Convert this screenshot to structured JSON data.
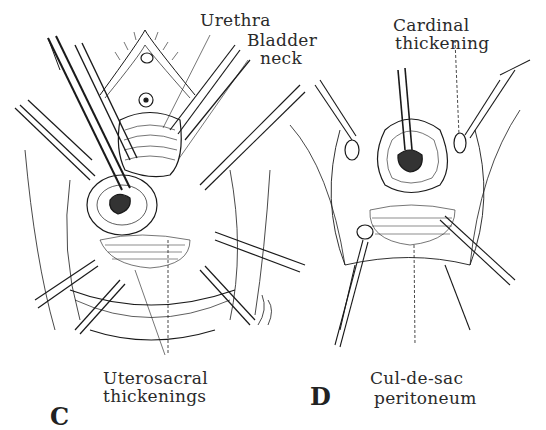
{
  "figure": {
    "panels": [
      {
        "id": "C",
        "letter": "C",
        "labels": {
          "urethra": "Urethra",
          "bladder_neck_1": "Bladder",
          "bladder_neck_2": "neck",
          "uterosacral_1": "Uterosacral",
          "uterosacral_2": "thickenings"
        }
      },
      {
        "id": "D",
        "letter": "D",
        "labels": {
          "cardinal_1": "Cardinal",
          "cardinal_2": "thickening",
          "culdesac_1": "Cul-de-sac",
          "culdesac_2": "peritoneum"
        }
      }
    ]
  }
}
